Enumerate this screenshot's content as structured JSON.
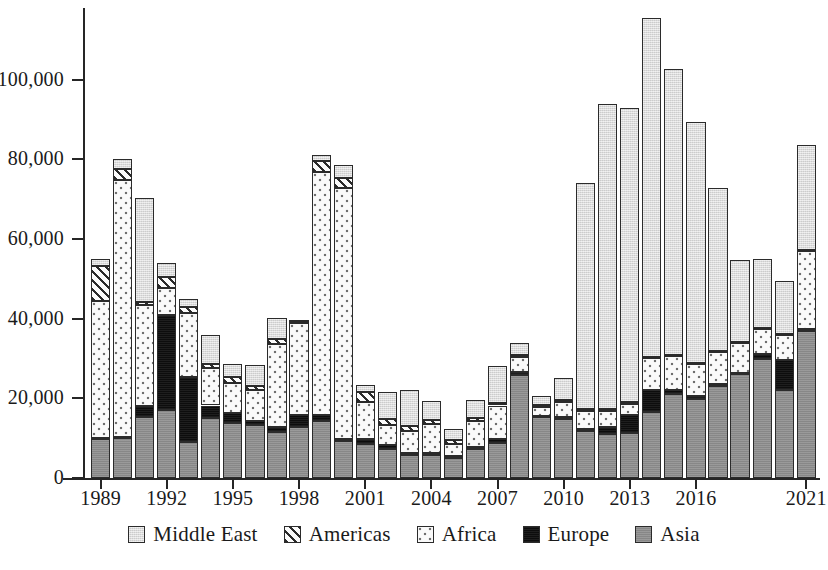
{
  "chart_data": {
    "type": "bar",
    "subtype": "stacked-bar",
    "title": "",
    "xlabel": "",
    "ylabel": "",
    "ylim": [
      0,
      118000
    ],
    "yticks": [
      0,
      20000,
      40000,
      60000,
      80000,
      100000
    ],
    "ytick_labels": [
      "0",
      "20,000",
      "40,000",
      "60,000",
      "80,000",
      "100,000"
    ],
    "grid": false,
    "legend_position": "bottom",
    "categories": [
      "1989",
      "1990",
      "1991",
      "1992",
      "1993",
      "1994",
      "1995",
      "1996",
      "1997",
      "1998",
      "1999",
      "2000",
      "2001",
      "2002",
      "2003",
      "2004",
      "2005",
      "2006",
      "2007",
      "2008",
      "2009",
      "2010",
      "2011",
      "2012",
      "2013",
      "2014",
      "2015",
      "2016",
      "2017",
      "2018",
      "2019",
      "2020",
      "2021"
    ],
    "xtick_labels": [
      "1989",
      "1992",
      "1995",
      "1998",
      "2001",
      "2004",
      "2007",
      "2010",
      "2013",
      "2016",
      "2021"
    ],
    "xtick_categories": [
      "1989",
      "1992",
      "1995",
      "1998",
      "2001",
      "2004",
      "2007",
      "2010",
      "2013",
      "2016",
      "2021"
    ],
    "series": [
      {
        "name": "Asia",
        "pattern": "solid-gray",
        "color": "#8e8e8e",
        "values": [
          9800,
          10000,
          15400,
          17000,
          9000,
          15000,
          13800,
          13300,
          11500,
          12700,
          14300,
          9400,
          8600,
          7400,
          5800,
          5700,
          5000,
          7300,
          8800,
          25800,
          15200,
          14800,
          11900,
          11000,
          11300,
          16500,
          21200,
          19900,
          23000,
          26000,
          30000,
          22000,
          37000
        ]
      },
      {
        "name": "Europe",
        "pattern": "solid-black",
        "color": "#0d0d0d",
        "values": [
          200,
          200,
          2600,
          24000,
          16400,
          3200,
          2600,
          1100,
          1200,
          3200,
          1600,
          400,
          1200,
          900,
          600,
          500,
          400,
          600,
          900,
          700,
          400,
          400,
          300,
          1700,
          4500,
          5500,
          1000,
          600,
          500,
          400,
          1100,
          7700,
          500
        ]
      },
      {
        "name": "Africa",
        "pattern": "dotted",
        "color": "#fafafa",
        "values": [
          34500,
          64500,
          25500,
          6800,
          16000,
          9500,
          7500,
          7600,
          21000,
          23000,
          61000,
          63000,
          9300,
          5000,
          5300,
          7300,
          3200,
          6500,
          8500,
          3800,
          2300,
          3900,
          4700,
          4200,
          2800,
          8200,
          8400,
          8100,
          8100,
          7400,
          6200,
          6100,
          19500
        ]
      },
      {
        "name": "Americas",
        "pattern": "diagonal-hatch",
        "color": "#fbfbfb",
        "values": [
          8800,
          2800,
          800,
          2600,
          1600,
          900,
          1400,
          1100,
          1100,
          300,
          2700,
          2500,
          2400,
          1600,
          1400,
          1100,
          900,
          700,
          600,
          500,
          500,
          600,
          500,
          400,
          400,
          300,
          300,
          300,
          300,
          300,
          300,
          300,
          300
        ]
      },
      {
        "name": "Middle East",
        "pattern": "light-gray",
        "color": "#dcdcdc",
        "values": [
          1700,
          2500,
          26000,
          3600,
          2000,
          7400,
          3200,
          5300,
          5400,
          500,
          1400,
          3200,
          1900,
          6600,
          9000,
          4700,
          2800,
          4600,
          9400,
          3200,
          2100,
          5300,
          56600,
          76700,
          74000,
          85000,
          71800,
          60600,
          40900,
          20600,
          17400,
          13400,
          26200
        ]
      }
    ]
  },
  "legend": {
    "items": [
      {
        "label": "Middle East",
        "key": "mideast"
      },
      {
        "label": "Americas",
        "key": "americas"
      },
      {
        "label": "Africa",
        "key": "africa"
      },
      {
        "label": "Europe",
        "key": "europe"
      },
      {
        "label": "Asia",
        "key": "asia"
      }
    ]
  }
}
